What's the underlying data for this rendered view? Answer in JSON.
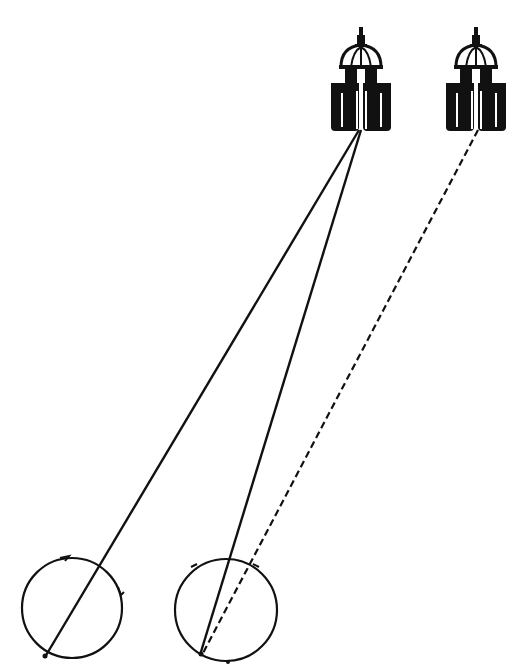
{
  "diagram": {
    "colors": {
      "ink": "#111111",
      "background": "#ffffff"
    },
    "buildings": [
      {
        "id": "building-near",
        "cx": 361,
        "base_y": 131
      },
      {
        "id": "building-far",
        "cx": 476,
        "base_y": 131
      }
    ],
    "eyes": [
      {
        "id": "eye-left",
        "cx": 72,
        "cy": 608,
        "r": 50
      },
      {
        "id": "eye-right",
        "cx": 226,
        "cy": 610,
        "r": 51
      }
    ],
    "lines": [
      {
        "id": "ray-near-to-left-eye",
        "style": "solid",
        "from": [
          359,
          130
        ],
        "to": [
          45,
          657
        ]
      },
      {
        "id": "ray-near-to-right-eye",
        "style": "solid",
        "from": [
          361,
          130
        ],
        "to": [
          200,
          655
        ]
      },
      {
        "id": "ray-far-to-right-eye",
        "style": "dashed",
        "from": [
          478,
          130
        ],
        "to": [
          202,
          655
        ]
      }
    ]
  }
}
